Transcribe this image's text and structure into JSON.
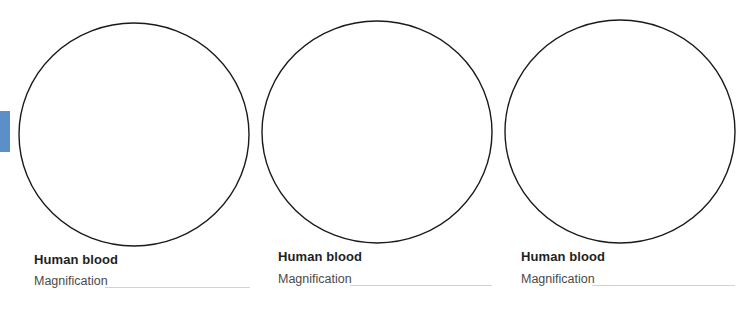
{
  "side_tab": {
    "color": "#5b8fc8"
  },
  "panels": [
    {
      "title": "Human blood",
      "magnification_label": "Magnification",
      "magnification_value": ""
    },
    {
      "title": "Human blood",
      "magnification_label": "Magnification",
      "magnification_value": ""
    },
    {
      "title": "Human blood",
      "magnification_label": "Magnification",
      "magnification_value": ""
    }
  ]
}
